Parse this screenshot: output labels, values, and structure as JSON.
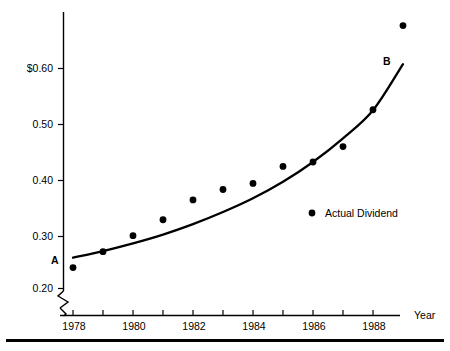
{
  "chart_data": {
    "type": "scatter",
    "title": "",
    "subtitle": "",
    "xlabel": "Year",
    "ylabel": "",
    "grid": false,
    "legend_position": "inside-right",
    "x": [
      1978,
      1979,
      1980,
      1981,
      1982,
      1983,
      1984,
      1985,
      1986,
      1987,
      1988,
      1989
    ],
    "xlim": [
      1977.6,
      1989.5
    ],
    "ylim": [
      0.195,
      0.7
    ],
    "x_tick_labels": [
      "1978",
      "",
      "1980",
      "",
      "1982",
      "",
      "1984",
      "",
      "1986",
      "",
      "1988",
      ""
    ],
    "x_major_labels": [
      "1978",
      "1980",
      "1982",
      "1984",
      "1986",
      "1988"
    ],
    "y_tick_labels": [
      "$0.60",
      "0.50",
      "0.40",
      "0.30",
      "0.20"
    ],
    "y_tick_values": [
      0.6,
      0.5,
      0.4,
      0.3,
      0.2
    ],
    "y_axis_broken": true,
    "series": [
      {
        "name": "Actual Dividend",
        "marker": "filled-circle",
        "color": "#000000",
        "values": [
          0.238,
          0.267,
          0.296,
          0.325,
          0.361,
          0.38,
          0.391,
          0.422,
          0.43,
          0.458,
          0.525,
          0.678
        ]
      },
      {
        "name": "Trend Line A to B",
        "marker": "line",
        "color": "#000000",
        "values": [
          0.256,
          0.268,
          0.282,
          0.298,
          0.317,
          0.339,
          0.364,
          0.394,
          0.43,
          0.473,
          0.524,
          0.608
        ]
      }
    ],
    "annotations": [
      {
        "text": "A",
        "x": 1978,
        "y": 0.256,
        "note": "start of fitted trend line"
      },
      {
        "text": "B",
        "x": 1989,
        "y": 0.608,
        "note": "end of fitted trend line"
      }
    ],
    "legend": [
      {
        "label": "Actual Dividend",
        "marker": "filled-circle"
      }
    ]
  },
  "axes": {
    "x_title": "Year",
    "y_ticks": [
      {
        "label": "$0.60"
      },
      {
        "label": "0.50"
      },
      {
        "label": "0.40"
      },
      {
        "label": "0.30"
      },
      {
        "label": "0.20"
      }
    ],
    "x_ticks": [
      {
        "label": "1978"
      },
      {
        "label": "1980"
      },
      {
        "label": "1982"
      },
      {
        "label": "1984"
      },
      {
        "label": "1986"
      },
      {
        "label": "1988"
      }
    ]
  },
  "annotations": {
    "point_a": "A",
    "point_b": "B"
  },
  "legend": {
    "actual_dividend": "Actual Dividend"
  },
  "colors": {
    "ink": "#000000",
    "paper": "#ffffff"
  }
}
